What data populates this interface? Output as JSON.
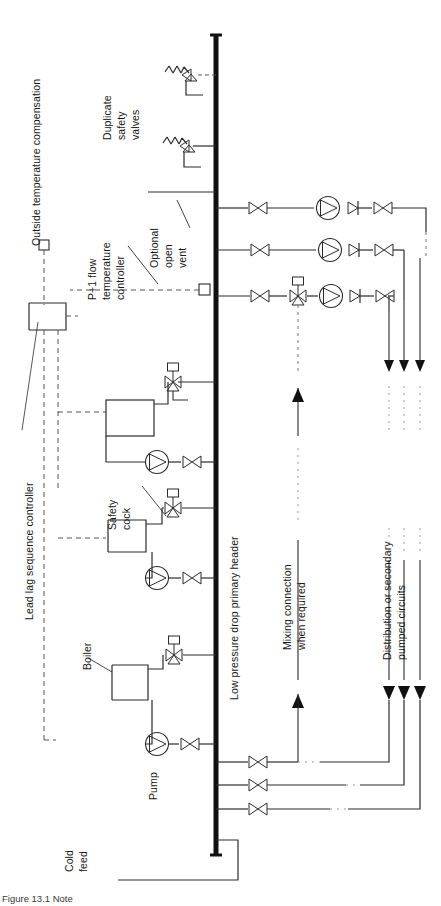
{
  "figure": {
    "caption": "Figure 13.1 Note",
    "type": "engineering-schematic",
    "orientation": "rotated-90-ccw"
  },
  "labels": {
    "outside_temp_compensation": "Outside temperature compensation",
    "duplicate_safety_valves_l1": "Duplicate",
    "duplicate_safety_valves_l2": "safety",
    "duplicate_safety_valves_l3": "valves",
    "flow_temp_controller_l1": "P+1 flow",
    "flow_temp_controller_l2": "temperature",
    "flow_temp_controller_l3": "controller",
    "optional_open_vent_l1": "Optional",
    "optional_open_vent_l2": "open",
    "optional_open_vent_l3": "vent",
    "lead_lag_sequence_controller": "Lead lag sequence controller",
    "safety_cock_l1": "Safety",
    "safety_cock_l2": "cock",
    "boiler": "Boiler",
    "pump": "Pump",
    "cold_feed_l1": "Cold",
    "cold_feed_l2": "feed",
    "primary_header": "Low pressure drop primary header",
    "mixing_connection_l1": "Mixing connection",
    "mixing_connection_l2": "when required",
    "distribution_circuits_l1": "Distribution or secondary",
    "distribution_circuits_l2": "pumped circuits"
  },
  "components": {
    "header_pipe": {
      "name": "Low pressure drop primary header",
      "style": "thick-vertical-line"
    },
    "boilers": [
      {
        "index": 1,
        "label": "Boiler",
        "has_pump": true,
        "has_check_valve": true,
        "has_safety_valve": true,
        "has_safety_cock": true
      },
      {
        "index": 2,
        "label": "Boiler",
        "has_pump": true,
        "has_check_valve": true,
        "has_safety_valve": true,
        "has_safety_cock": true
      },
      {
        "index": 3,
        "label": "Boiler",
        "has_pump": true,
        "has_check_valve": true,
        "has_safety_valve": true,
        "has_safety_cock": true
      }
    ],
    "safety_valves": [
      {
        "index": 1,
        "type": "spring-loaded-relief"
      },
      {
        "index": 2,
        "type": "spring-loaded-relief"
      }
    ],
    "secondary_circuits": [
      {
        "index": 1,
        "isolating_valve": true,
        "pump": true,
        "check_valve": true,
        "regulating_valve": true,
        "mixing_valve": false
      },
      {
        "index": 2,
        "isolating_valve": true,
        "pump": true,
        "check_valve": true,
        "regulating_valve": true,
        "mixing_valve": false
      },
      {
        "index": 3,
        "isolating_valve": true,
        "pump": true,
        "check_valve": true,
        "regulating_valve": true,
        "mixing_valve": true
      }
    ],
    "returns": [
      {
        "index": 1,
        "valve": true
      },
      {
        "index": 2,
        "valve": true
      },
      {
        "index": 3,
        "valve": true
      }
    ],
    "sensors": [
      {
        "name": "outside-temperature-sensor",
        "symbol": "small-square"
      },
      {
        "name": "flow-temperature-sensor",
        "symbol": "small-square"
      }
    ],
    "controllers": [
      {
        "name": "lead-lag-sequence-controller",
        "symbol": "rectangle"
      }
    ],
    "cold_feed": {
      "name": "Cold feed",
      "symbol": "open-rectangle"
    },
    "open_vent": {
      "name": "Optional open vent",
      "symbol": "open-pipe"
    }
  },
  "colors": {
    "line": "#2b2b2b",
    "header": "#111111",
    "control_line": "#555555",
    "text": "#171717",
    "background": "#ffffff"
  }
}
